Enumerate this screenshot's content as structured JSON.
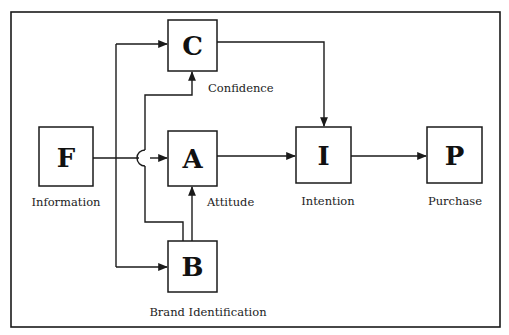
{
  "diagram": {
    "frame": {
      "x": 11,
      "y": 12,
      "w": 489,
      "h": 315
    },
    "stroke_color": "#1a1a1a",
    "nodes": {
      "C": {
        "letter": "C",
        "label": "Confidence",
        "x": 168,
        "y": 20,
        "w": 49,
        "h": 51
      },
      "F": {
        "letter": "F",
        "label": "Information",
        "x": 39,
        "y": 127,
        "w": 54,
        "h": 59
      },
      "A": {
        "letter": "A",
        "label": "Attitude",
        "x": 168,
        "y": 131,
        "w": 49,
        "h": 55
      },
      "I": {
        "letter": "I",
        "label": "Intention",
        "x": 296,
        "y": 127,
        "w": 55,
        "h": 56
      },
      "P": {
        "letter": "P",
        "label": "Purchase",
        "x": 427,
        "y": 127,
        "w": 55,
        "h": 56
      },
      "B": {
        "letter": "B",
        "label": "Brand Identification",
        "x": 168,
        "y": 241,
        "w": 49,
        "h": 51
      }
    },
    "edges": [
      {
        "from": "F",
        "to": "C"
      },
      {
        "from": "F",
        "to": "A"
      },
      {
        "from": "F",
        "to": "B"
      },
      {
        "from": "F",
        "to": "C",
        "via": "junction"
      },
      {
        "from": "F",
        "to": "B",
        "via": "junction"
      },
      {
        "from": "B",
        "to": "A"
      },
      {
        "from": "C",
        "to": "I"
      },
      {
        "from": "A",
        "to": "I"
      },
      {
        "from": "I",
        "to": "P"
      }
    ]
  }
}
